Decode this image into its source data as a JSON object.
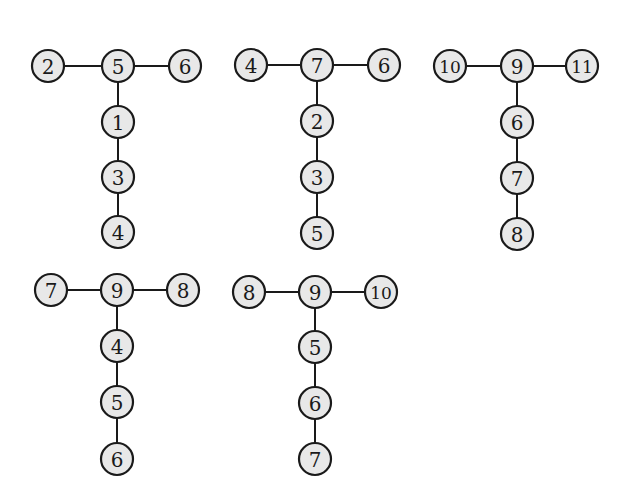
{
  "diagram": {
    "type": "tree-collection",
    "node_radius": 16,
    "colors": {
      "node_fill": "#e8e8e8",
      "node_stroke": "#1a1a1a",
      "edge": "#1a1a1a",
      "background": "#ffffff"
    },
    "trees": [
      {
        "id": "tree-1",
        "nodes": [
          {
            "label": "2",
            "x": 48,
            "y": 66
          },
          {
            "label": "5",
            "x": 118,
            "y": 66
          },
          {
            "label": "6",
            "x": 185,
            "y": 66
          },
          {
            "label": "1",
            "x": 118,
            "y": 122
          },
          {
            "label": "3",
            "x": 118,
            "y": 177
          },
          {
            "label": "4",
            "x": 118,
            "y": 232
          }
        ],
        "edges": [
          [
            0,
            1
          ],
          [
            1,
            2
          ],
          [
            1,
            3
          ],
          [
            3,
            4
          ],
          [
            4,
            5
          ]
        ]
      },
      {
        "id": "tree-2",
        "nodes": [
          {
            "label": "4",
            "x": 251,
            "y": 65
          },
          {
            "label": "7",
            "x": 317,
            "y": 65
          },
          {
            "label": "6",
            "x": 384,
            "y": 65
          },
          {
            "label": "2",
            "x": 317,
            "y": 121
          },
          {
            "label": "3",
            "x": 317,
            "y": 177
          },
          {
            "label": "5",
            "x": 317,
            "y": 233
          }
        ],
        "edges": [
          [
            0,
            1
          ],
          [
            1,
            2
          ],
          [
            1,
            3
          ],
          [
            3,
            4
          ],
          [
            4,
            5
          ]
        ]
      },
      {
        "id": "tree-3",
        "nodes": [
          {
            "label": "10",
            "x": 450,
            "y": 66
          },
          {
            "label": "9",
            "x": 517,
            "y": 66
          },
          {
            "label": "11",
            "x": 582,
            "y": 66
          },
          {
            "label": "6",
            "x": 517,
            "y": 122
          },
          {
            "label": "7",
            "x": 517,
            "y": 178
          },
          {
            "label": "8",
            "x": 517,
            "y": 234
          }
        ],
        "edges": [
          [
            0,
            1
          ],
          [
            1,
            2
          ],
          [
            1,
            3
          ],
          [
            3,
            4
          ],
          [
            4,
            5
          ]
        ]
      },
      {
        "id": "tree-4",
        "nodes": [
          {
            "label": "7",
            "x": 51,
            "y": 290
          },
          {
            "label": "9",
            "x": 117,
            "y": 290
          },
          {
            "label": "8",
            "x": 183,
            "y": 290
          },
          {
            "label": "4",
            "x": 117,
            "y": 346
          },
          {
            "label": "5",
            "x": 117,
            "y": 402
          },
          {
            "label": "6",
            "x": 117,
            "y": 459
          }
        ],
        "edges": [
          [
            0,
            1
          ],
          [
            1,
            2
          ],
          [
            1,
            3
          ],
          [
            3,
            4
          ],
          [
            4,
            5
          ]
        ]
      },
      {
        "id": "tree-5",
        "nodes": [
          {
            "label": "8",
            "x": 249,
            "y": 292
          },
          {
            "label": "9",
            "x": 315,
            "y": 292
          },
          {
            "label": "10",
            "x": 381,
            "y": 292
          },
          {
            "label": "5",
            "x": 315,
            "y": 347
          },
          {
            "label": "6",
            "x": 315,
            "y": 403
          },
          {
            "label": "7",
            "x": 315,
            "y": 459
          }
        ],
        "edges": [
          [
            0,
            1
          ],
          [
            1,
            2
          ],
          [
            1,
            3
          ],
          [
            3,
            4
          ],
          [
            4,
            5
          ]
        ]
      }
    ]
  }
}
